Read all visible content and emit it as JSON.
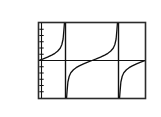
{
  "figure": {
    "exercise_number": "67.",
    "labels": {
      "y_max": "6",
      "y_zero": "0",
      "x_max": "2",
      "y_min": "-6"
    }
  },
  "chart_data": {
    "type": "line",
    "title": "",
    "subtitle": "",
    "xlabel": "",
    "ylabel": "",
    "xlim": [
      0,
      2
    ],
    "ylim": [
      -6,
      6
    ],
    "grid": false,
    "legend": null,
    "tick_labels": {
      "x": [
        "0",
        "2"
      ],
      "y": [
        "-6",
        "0",
        "6"
      ]
    },
    "y_axis_ticks_count": 12,
    "axes_drawn": {
      "x_axis_at_y": 0,
      "y_axis_at_x": 0
    },
    "asymptotes": {
      "vertical": [
        0.5,
        1.5
      ],
      "style": "thick vertical segments"
    },
    "annotations": [
      "Graphing-calculator style viewing window with frame border",
      "Two periods of a tangent-like curve",
      "Curve passes through (0,0), (1,0) and (2,0)"
    ],
    "series": [
      {
        "name": "y = tan(pi*x)",
        "description": "Tangent-like curve with period 1, vertical asymptotes at x=0.5 and x=1.5, zeros at x=0, 1, 2",
        "x": [
          0.0,
          0.08,
          0.16,
          0.24,
          0.3,
          0.35,
          0.4,
          0.43,
          0.455,
          0.47,
          0.48,
          0.52,
          0.53,
          0.545,
          0.57,
          0.6,
          0.65,
          0.7,
          0.76,
          0.84,
          0.92,
          1.0,
          1.08,
          1.16,
          1.24,
          1.3,
          1.35,
          1.4,
          1.43,
          1.455,
          1.47,
          1.48,
          1.52,
          1.53,
          1.545,
          1.57,
          1.6,
          1.65,
          1.7,
          1.76,
          1.84,
          1.92,
          2.0
        ],
        "y": [
          0.0,
          0.26,
          0.54,
          0.87,
          1.15,
          1.48,
          1.96,
          2.52,
          3.44,
          4.9,
          6.0,
          -6.0,
          -4.9,
          -3.44,
          -2.52,
          -1.96,
          -1.48,
          -1.15,
          -0.87,
          -0.54,
          -0.26,
          0.0,
          0.26,
          0.54,
          0.87,
          1.15,
          1.48,
          1.96,
          2.52,
          3.44,
          4.9,
          6.0,
          -6.0,
          -4.9,
          -3.44,
          -2.52,
          -1.96,
          -1.48,
          -1.15,
          -0.87,
          -0.54,
          -0.26,
          0.0
        ]
      }
    ],
    "colors": {
      "curve": "#111111",
      "axis": "#111111",
      "frame": "#2b2b2b",
      "background": "#ffffff"
    }
  }
}
